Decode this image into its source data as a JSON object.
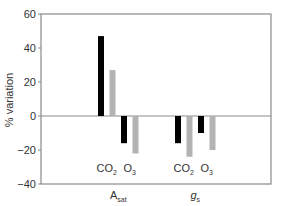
{
  "chart_data": {
    "type": "bar",
    "title": "",
    "xlabel": "",
    "ylabel": "% variation",
    "ylim": [
      -40,
      60
    ],
    "yticks": [
      60,
      40,
      20,
      0,
      -20,
      -40
    ],
    "grid": false,
    "legend": null,
    "groups": [
      {
        "label": "A",
        "label_sub": "sat",
        "label_italic": false,
        "treatments": [
          {
            "label": "CO",
            "label_sub": "2",
            "bars": [
              {
                "series": "black",
                "value": 47
              },
              {
                "series": "gray",
                "value": 27
              }
            ]
          },
          {
            "label": "O",
            "label_sub": "3",
            "bars": [
              {
                "series": "black",
                "value": -16
              },
              {
                "series": "gray",
                "value": -22
              }
            ]
          }
        ]
      },
      {
        "label": "g",
        "label_sub": "s",
        "label_italic": true,
        "treatments": [
          {
            "label": "CO",
            "label_sub": "2",
            "bars": [
              {
                "series": "black",
                "value": -16
              },
              {
                "series": "gray",
                "value": -24
              }
            ]
          },
          {
            "label": "O",
            "label_sub": "3",
            "bars": [
              {
                "series": "black",
                "value": -10
              },
              {
                "series": "gray",
                "value": -20
              }
            ]
          }
        ]
      }
    ],
    "series_colors": {
      "black": "#000000",
      "gray": "#b3b3b3"
    }
  },
  "axis_color": "#8a8a8a"
}
